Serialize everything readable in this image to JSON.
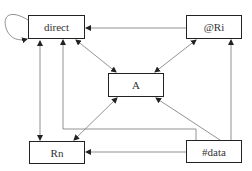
{
  "diagram": {
    "nodes": [
      {
        "id": "direct",
        "label": "direct",
        "x": 28,
        "y": 15,
        "w": 57,
        "h": 24
      },
      {
        "id": "ri",
        "label": "@Ri",
        "x": 186,
        "y": 15,
        "w": 56,
        "h": 24
      },
      {
        "id": "a",
        "label": "A",
        "x": 108,
        "y": 73,
        "w": 56,
        "h": 24
      },
      {
        "id": "rn",
        "label": "Rn",
        "x": 29,
        "y": 141,
        "w": 56,
        "h": 23
      },
      {
        "id": "data",
        "label": "#data",
        "x": 186,
        "y": 140,
        "w": 56,
        "h": 23
      }
    ],
    "edges": [
      {
        "from": "direct",
        "to": "direct",
        "type": "self-loop"
      },
      {
        "from": "ri",
        "to": "direct",
        "type": "arrow"
      },
      {
        "from": "direct",
        "to": "a",
        "type": "bidirectional"
      },
      {
        "from": "ri",
        "to": "a",
        "type": "bidirectional"
      },
      {
        "from": "direct",
        "to": "rn",
        "type": "bidirectional"
      },
      {
        "from": "a",
        "to": "rn",
        "type": "bidirectional"
      },
      {
        "from": "data",
        "to": "a",
        "type": "arrow"
      },
      {
        "from": "data",
        "to": "ri",
        "type": "arrow"
      },
      {
        "from": "data",
        "to": "rn",
        "type": "arrow"
      },
      {
        "from": "data",
        "to": "direct",
        "type": "arrow-elbow"
      }
    ]
  }
}
